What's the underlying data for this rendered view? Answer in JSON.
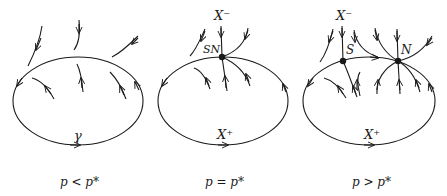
{
  "panels": [
    {
      "caption": "p < p*",
      "orbit_label": "γ"
    },
    {
      "caption": "p = p*",
      "top_label": "X⁻",
      "bottom_label": "X⁺",
      "point_label": "SN"
    },
    {
      "caption": "p > p*",
      "top_label": "X⁻",
      "bottom_label": "X⁺",
      "saddle_label": "S",
      "node_label": "N"
    }
  ]
}
